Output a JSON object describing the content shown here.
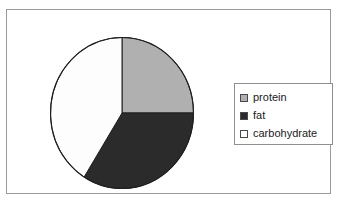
{
  "figure": {
    "background_color": "#ffffff",
    "frame_border_color": "#9a9a9a"
  },
  "legend": {
    "border_color": "#8f8f8f",
    "background_color": "#ffffff",
    "position": "center-right",
    "entries": [
      {
        "label": "protein",
        "swatch_color": "#b0b0b0",
        "swatch_name": "legend-swatch-protein"
      },
      {
        "label": "fat",
        "swatch_color": "#2b2b2b",
        "swatch_name": "legend-swatch-fat"
      },
      {
        "label": "carbohydrate",
        "swatch_color": "#fdfdfd",
        "swatch_name": "legend-swatch-carbohydrate"
      }
    ]
  },
  "chart_data": {
    "type": "pie",
    "title": "",
    "subtitle": "",
    "xlabel": "",
    "ylabel": "",
    "grid": false,
    "legend_position": "center-right",
    "start_angle_deg": 90,
    "direction": "clockwise",
    "categories": [
      "protein",
      "fat",
      "carbohydrate"
    ],
    "values": [
      25,
      34,
      41
    ],
    "units": "percent",
    "colors": [
      "#b0b0b0",
      "#2b2b2b",
      "#fdfdfd"
    ],
    "slice_edge_color": "#1f1f1f",
    "slices": [
      {
        "label": "protein",
        "value": 25,
        "start_deg": 0,
        "end_deg": 90,
        "color": "#b0b0b0"
      },
      {
        "label": "fat",
        "value": 34,
        "start_deg": 90,
        "end_deg": 212,
        "color": "#2b2b2b"
      },
      {
        "label": "carbohydrate",
        "value": 41,
        "start_deg": 212,
        "end_deg": 360,
        "color": "#fdfdfd"
      }
    ],
    "annotations": []
  }
}
